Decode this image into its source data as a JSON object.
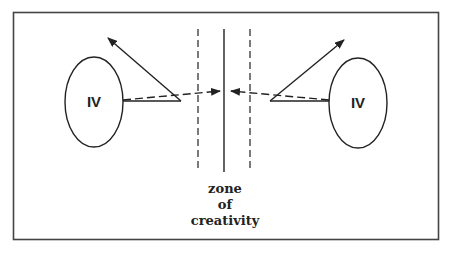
{
  "diagram": {
    "left_node": {
      "label": "IV"
    },
    "right_node": {
      "label": "IV"
    },
    "caption": {
      "line1": "zone",
      "line2": "of",
      "line3": "creativity"
    },
    "colors": {
      "stroke": "#222222",
      "frame": "#444444",
      "background": "#ffffff"
    }
  }
}
